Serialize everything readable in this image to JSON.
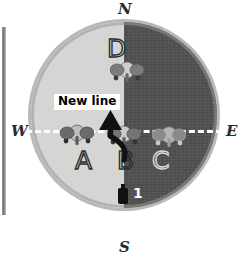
{
  "figure": {
    "arena": {
      "left_half_label": "light-shaded-half",
      "right_half_label": "dark-shaded-half",
      "left_half_color": "#d5d5d3",
      "right_half_color": "#4e4e4e",
      "rim_color": "#b9b9b9"
    },
    "compass": {
      "north": "N",
      "south": "S",
      "west": "W",
      "east": "E"
    },
    "axis": {
      "name": "west-east-dashed-axis",
      "color": "#ffffff",
      "style": "dashed"
    },
    "callout": {
      "text": "New line",
      "background": "#ffffff",
      "text_color": "#000000"
    },
    "arrow": {
      "name": "curved-up-arrow",
      "color": "#111111",
      "direction": "up"
    },
    "zones": [
      {
        "id": "A",
        "label": "A",
        "half": "light"
      },
      {
        "id": "B",
        "label": "B",
        "half": "light"
      },
      {
        "id": "C",
        "label": "C",
        "half": "dark"
      },
      {
        "id": "D",
        "label": "D",
        "half": "light"
      }
    ],
    "animals": [
      {
        "id": "elephant-a",
        "zone": "A"
      },
      {
        "id": "elephant-b",
        "zone": "B"
      },
      {
        "id": "elephant-c",
        "zone": "C"
      },
      {
        "id": "elephant-d",
        "zone": "D"
      }
    ],
    "observer": {
      "marker_label": "1",
      "marker_color": "#111111",
      "label_color": "#ffffff"
    }
  }
}
